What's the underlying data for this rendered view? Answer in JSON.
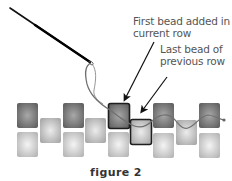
{
  "figure": {
    "caption": "figure 2",
    "labels": {
      "first_bead": {
        "line1": "First bead added in",
        "line2": "current row"
      },
      "last_bead": {
        "line1": "Last bead of",
        "line2": "previous row"
      }
    }
  },
  "colors": {
    "dark_bead": "#6e6e6e",
    "light_bead": "#c8c8c8",
    "bead_outline": "#1e1e1e",
    "thread": "#707070",
    "needle": "#111111",
    "text": "#555555"
  },
  "beads": {
    "top_row_dark": [
      {
        "x": 17,
        "y": 103
      },
      {
        "x": 63,
        "y": 103
      },
      {
        "x": 108,
        "y": 103,
        "highlighted": true
      },
      {
        "x": 153,
        "y": 103
      },
      {
        "x": 199,
        "y": 103
      }
    ],
    "middle_row": [
      {
        "x": 40,
        "y": 118
      },
      {
        "x": 85,
        "y": 118
      },
      {
        "x": 131,
        "y": 119,
        "highlighted": true
      },
      {
        "x": 176,
        "y": 120
      }
    ],
    "bottom_row_light": [
      {
        "x": 17,
        "y": 132
      },
      {
        "x": 63,
        "y": 132
      },
      {
        "x": 108,
        "y": 132
      },
      {
        "x": 153,
        "y": 133
      },
      {
        "x": 199,
        "y": 133
      }
    ]
  }
}
